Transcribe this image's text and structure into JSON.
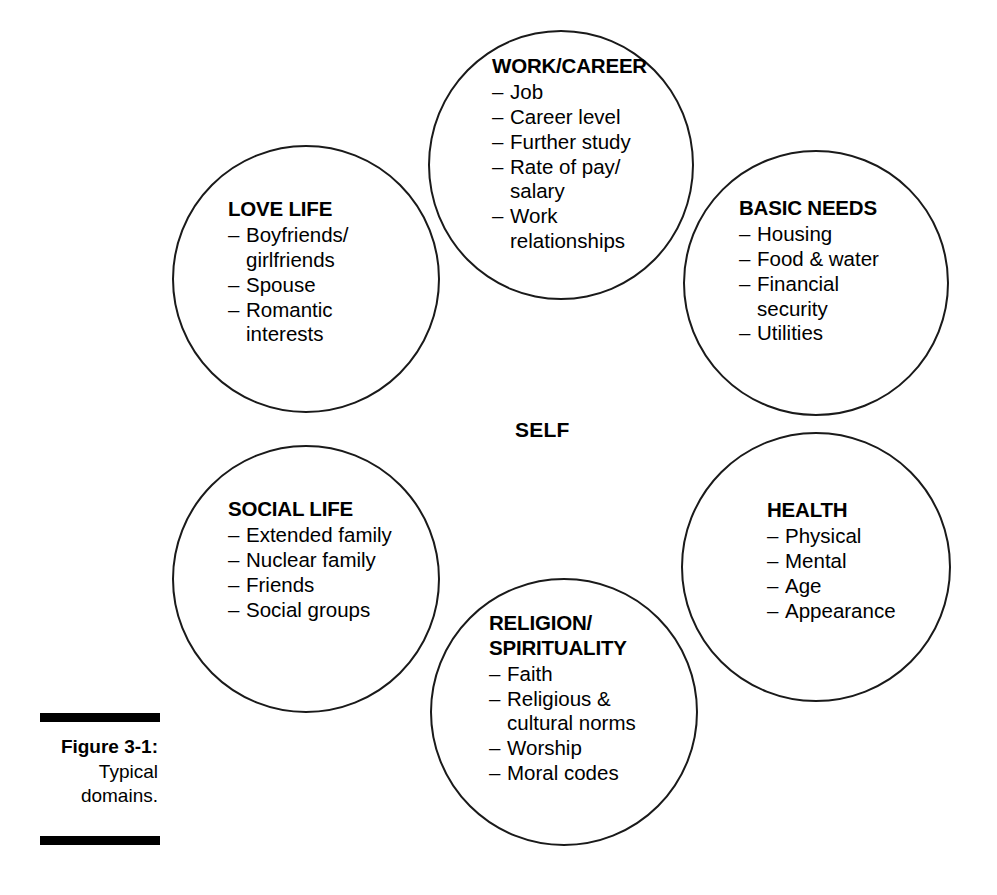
{
  "figure": {
    "self_label": "SELF",
    "caption": {
      "figure_number": "Figure 3-1:",
      "line1": "Typical",
      "line2": "domains."
    },
    "domains": [
      {
        "id": "work-career",
        "title": "WORK/CAREER",
        "items": [
          "Job",
          "Career level",
          "Further study",
          "Rate of pay/\nsalary",
          "Work\nrelationships"
        ]
      },
      {
        "id": "love-life",
        "title": "LOVE LIFE",
        "items": [
          "Boyfriends/\ngirlfriends",
          "Spouse",
          "Romantic\ninterests"
        ]
      },
      {
        "id": "basic-needs",
        "title": "BASIC NEEDS",
        "items": [
          "Housing",
          "Food & water",
          "Financial\nsecurity",
          "Utilities"
        ]
      },
      {
        "id": "social-life",
        "title": "SOCIAL LIFE",
        "items": [
          "Extended family",
          "Nuclear family",
          "Friends",
          "Social groups"
        ]
      },
      {
        "id": "religion-spirituality",
        "title": "RELIGION/\nSPIRITUALITY",
        "items": [
          "Faith",
          "Religious &\ncultural norms",
          "Worship",
          "Moral codes"
        ]
      },
      {
        "id": "health",
        "title": "HEALTH",
        "items": [
          "Physical",
          "Mental",
          "Age",
          "Appearance"
        ]
      }
    ]
  },
  "colors": {
    "stroke": "#1a1a1a",
    "text": "#000000",
    "background": "#ffffff"
  }
}
